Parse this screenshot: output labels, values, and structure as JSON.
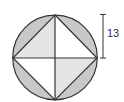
{
  "figure": {
    "dimension_label": "13",
    "colors": {
      "segment_fill": "#c8c8c8",
      "light_fill": "#e4e4e4",
      "white_fill": "#ffffff",
      "stroke": "#333333"
    },
    "shapes": {
      "circle": "circle with inscribed square",
      "square": "square rotated 45 degrees with both diagonals drawn"
    }
  }
}
